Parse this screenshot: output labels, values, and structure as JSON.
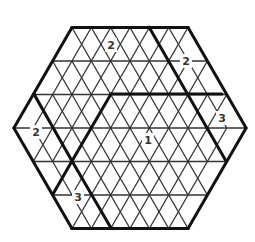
{
  "puzzle": {
    "type": "triangular-hexagon-grid",
    "side": 3,
    "center": [
      130,
      128
    ],
    "edge": 38.7,
    "row_height": 33.5,
    "colors": {
      "line": "#333333",
      "thick": "#111111",
      "background": "#ffffff"
    },
    "thick_lines": [
      [
        [
          111,
          94
        ],
        [
          222,
          94
        ]
      ],
      [
        [
          149,
          27
        ],
        [
          207,
          128
        ]
      ],
      [
        [
          207,
          128
        ],
        [
          226,
          161
        ]
      ],
      [
        [
          111,
          94
        ],
        [
          72,
          161
        ]
      ],
      [
        [
          34,
          94
        ],
        [
          72,
          161
        ]
      ],
      [
        [
          72,
          161
        ],
        [
          111,
          228
        ]
      ],
      [
        [
          72,
          161
        ],
        [
          53,
          194
        ]
      ]
    ],
    "clues": [
      {
        "value": "2",
        "x": 111,
        "y": 45
      },
      {
        "value": "2",
        "x": 186,
        "y": 61
      },
      {
        "value": "2",
        "x": 36,
        "y": 132
      },
      {
        "value": "3",
        "x": 222,
        "y": 118
      },
      {
        "value": "1",
        "x": 148,
        "y": 140
      },
      {
        "value": "3",
        "x": 78,
        "y": 197
      }
    ]
  }
}
